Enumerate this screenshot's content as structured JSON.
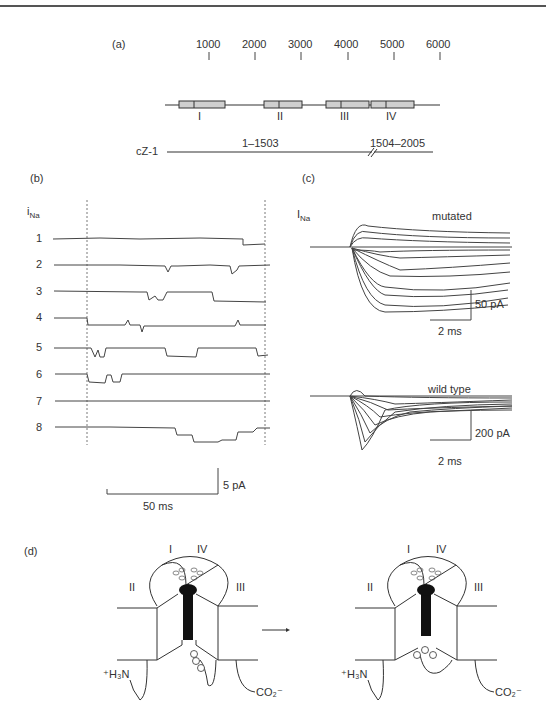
{
  "panel_a": {
    "label": "(a)",
    "scale_ticks": [
      "1000",
      "2000",
      "3000",
      "4000",
      "5000",
      "6000"
    ],
    "domains": [
      "I",
      "II",
      "III",
      "IV"
    ],
    "construct_name": "cZ-1",
    "segment_1": "1–1503",
    "segment_2": "1504–2005"
  },
  "panel_b": {
    "label": "(b)",
    "ylabel": "i",
    "ylabel_sub": "Na",
    "sweeps": [
      "1",
      "2",
      "3",
      "4",
      "5",
      "6",
      "7",
      "8"
    ],
    "scale_y": "5 pA",
    "scale_x": "50 ms"
  },
  "panel_c": {
    "label": "(c)",
    "ylabel": "I",
    "ylabel_sub": "Na",
    "top_title": "mutated",
    "top_scale_y": "50 pA",
    "top_scale_x": "2 ms",
    "bottom_title": "wild type",
    "bottom_scale_y": "200 pA",
    "bottom_scale_x": "2 ms"
  },
  "panel_d": {
    "label": "(d)",
    "left": {
      "domains": [
        "I",
        "IV",
        "II",
        "III"
      ],
      "n_term": "⁺H₃N",
      "c_term": "CO₂⁻",
      "residues": [
        "I",
        "F",
        "M"
      ]
    },
    "arrow": "→",
    "right": {
      "domains": [
        "I",
        "IV",
        "II",
        "III"
      ],
      "n_term": "⁺H₃N",
      "c_term": "CO₂⁻",
      "residues": [
        "M",
        "F",
        "I"
      ]
    }
  }
}
